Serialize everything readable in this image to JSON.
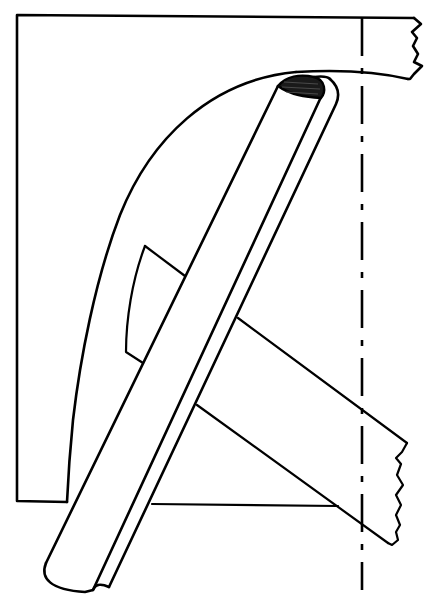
{
  "diagram": {
    "parts": [
      {
        "name": "rectangular-plate",
        "notes": "outline, left edge x≈17, top y≈15, bottom y≈503"
      },
      {
        "name": "upper-bar-broken-end",
        "notes": "horizontal bar at top right ending in a torn zigzag edge"
      },
      {
        "name": "curved-guide",
        "notes": "sweeping arc from bottom-left up to top of plate"
      },
      {
        "name": "diagonal-rod",
        "notes": "long cylindrical rod with groove, rounded bottom end"
      },
      {
        "name": "rod-end-cap-shaded",
        "notes": "hatched/dark elliptical cap at top of rod"
      },
      {
        "name": "crossing-bar-broken-end",
        "notes": "angled bar passing behind rod, torn end at right"
      },
      {
        "name": "small-curved-segment",
        "notes": "short curved piece between arc and rod"
      },
      {
        "name": "centerline",
        "notes": "vertical dash-dot line at x≈362"
      }
    ],
    "caption_partial": "cut off at bottom edge; illegible"
  }
}
